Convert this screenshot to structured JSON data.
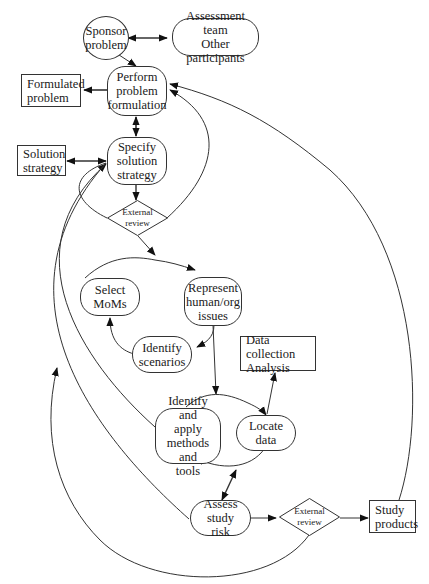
{
  "diagram": {
    "nodes": {
      "sponsor_problem": {
        "label": "Sponsor\nproblem",
        "shape": "ellipse"
      },
      "assessment_team": {
        "label": "Assessment team\nOther participants",
        "shape": "rounded"
      },
      "formulated_problem": {
        "label": "Formulated\nproblem",
        "shape": "rect"
      },
      "perform_problem_formulation": {
        "label": "Perform\nproblem\nformulation",
        "shape": "rounded"
      },
      "solution_strategy": {
        "label": "Solution\nstrategy",
        "shape": "rect"
      },
      "specify_solution_strategy": {
        "label": "Specify\nsolution\nstrategy",
        "shape": "rounded"
      },
      "external_review_1": {
        "label": "External\nreview",
        "shape": "diamond"
      },
      "select_moms": {
        "label": "Select\nMoMs",
        "shape": "rounded"
      },
      "represent_human_org": {
        "label": "Represent\nhuman/org\nissues",
        "shape": "rounded"
      },
      "identify_scenarios": {
        "label": "Identify\nscenarios",
        "shape": "rounded"
      },
      "data_collection": {
        "label": "Data collection\nAnalysis",
        "shape": "rect"
      },
      "identify_apply_methods": {
        "label": "Identify and\napply\nmethods and\ntools",
        "shape": "rounded"
      },
      "locate_data": {
        "label": "Locate\ndata",
        "shape": "rounded"
      },
      "assess_study_risk": {
        "label": "Assess study\nrisk",
        "shape": "rounded"
      },
      "external_review_2": {
        "label": "External\nreview",
        "shape": "diamond"
      },
      "study_products": {
        "label": "Study\nproducts",
        "shape": "rect"
      }
    },
    "edges": [
      {
        "from": "sponsor_problem",
        "to": "assessment_team",
        "bidirectional": true
      },
      {
        "from": "sponsor_problem",
        "to": "perform_problem_formulation"
      },
      {
        "from": "perform_problem_formulation",
        "to": "formulated_problem"
      },
      {
        "from": "perform_problem_formulation",
        "to": "specify_solution_strategy",
        "bidirectional": true
      },
      {
        "from": "specify_solution_strategy",
        "to": "solution_strategy",
        "bidirectional": true
      },
      {
        "from": "specify_solution_strategy",
        "to": "external_review_1"
      },
      {
        "from": "external_review_1",
        "to": "perform_problem_formulation"
      },
      {
        "from": "external_review_1",
        "to": "specify_solution_strategy"
      },
      {
        "from": "external_review_1",
        "to": "represent_human_org"
      },
      {
        "from": "select_moms",
        "to": "represent_human_org"
      },
      {
        "from": "represent_human_org",
        "to": "identify_scenarios"
      },
      {
        "from": "identify_scenarios",
        "to": "select_moms"
      },
      {
        "from": "represent_human_org",
        "to": "identify_apply_methods"
      },
      {
        "from": "identify_apply_methods",
        "to": "locate_data"
      },
      {
        "from": "locate_data",
        "to": "identify_apply_methods"
      },
      {
        "from": "locate_data",
        "to": "data_collection"
      },
      {
        "from": "locate_data",
        "to": "assess_study_risk",
        "bidirectional": true
      },
      {
        "from": "identify_apply_methods",
        "to": "specify_solution_strategy"
      },
      {
        "from": "assess_study_risk",
        "to": "specify_solution_strategy"
      },
      {
        "from": "assess_study_risk",
        "to": "external_review_2"
      },
      {
        "from": "external_review_2",
        "to": "study_products"
      },
      {
        "from": "external_review_2",
        "to": "specify_solution_strategy"
      },
      {
        "from": "study_products",
        "to": "perform_problem_formulation"
      }
    ],
    "colors": {
      "stroke": "#333333",
      "background": "#ffffff",
      "text": "#1a1a1a"
    }
  }
}
